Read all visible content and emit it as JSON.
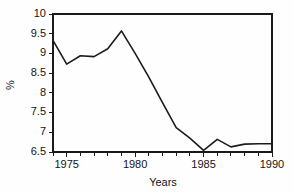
{
  "chart_data": {
    "type": "line",
    "title": "",
    "subtitle": "",
    "xlabel": "Years",
    "ylabel": "%",
    "x": [
      1974,
      1975,
      1976,
      1977,
      1978,
      1979,
      1980,
      1981,
      1982,
      1983,
      1984,
      1985,
      1986,
      1987,
      1988,
      1989,
      1990
    ],
    "values": [
      9.33,
      8.73,
      8.94,
      8.92,
      9.12,
      9.57,
      9.0,
      8.4,
      7.75,
      7.12,
      6.85,
      6.54,
      6.82,
      6.63,
      6.7,
      6.71,
      6.71
    ],
    "series": [
      {
        "name": "",
        "values": [
          9.33,
          8.73,
          8.94,
          8.92,
          9.12,
          9.57,
          9.0,
          8.4,
          7.75,
          7.12,
          6.85,
          6.54,
          6.82,
          6.63,
          6.7,
          6.71,
          6.71
        ]
      }
    ],
    "xlim": [
      1974,
      1990
    ],
    "ylim": [
      6.5,
      10
    ],
    "xticks": [
      1975,
      1980,
      1985,
      1990
    ],
    "xtick_labels": [
      "1975",
      "1980",
      "1985",
      "1990"
    ],
    "xminor_ticks": [
      1974,
      1975,
      1976,
      1977,
      1978,
      1979,
      1980,
      1981,
      1982,
      1983,
      1984,
      1985,
      1986,
      1987,
      1988,
      1989,
      1990
    ],
    "yticks": [
      6.5,
      7,
      7.5,
      8,
      8.5,
      9,
      9.5,
      10
    ],
    "ytick_labels": [
      "6.5",
      "7",
      "7.5",
      "8",
      "8.5",
      "9",
      "9.5",
      "10"
    ],
    "grid": false,
    "legend": false,
    "legend_position": "none",
    "line_color": "#1c1c1c",
    "axis_color": "#1a1a1a",
    "background_color": "#fefefe"
  }
}
